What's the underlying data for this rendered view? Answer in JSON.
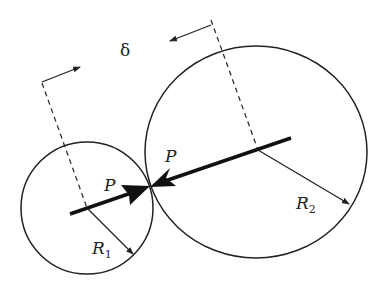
{
  "figure": {
    "labels": {
      "delta": "δ",
      "force_left": "P",
      "force_right": "P",
      "radius1": "R",
      "radius1_sub": "1",
      "radius2": "R",
      "radius2_sub": "2"
    },
    "colors": {
      "stroke": "#222222",
      "background": "#ffffff"
    }
  }
}
